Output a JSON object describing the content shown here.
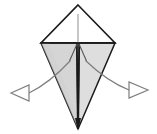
{
  "figure": {
    "title": "Origami fold step diagram",
    "canvas": {
      "width": 157,
      "height": 134,
      "background": "#ffffff"
    }
  },
  "colors": {
    "paper_outline": "#1a1a1a",
    "flap_left_fill": "#d5d5d5",
    "flap_right_fill": "#dedede",
    "top_face_fill": "#ffffff",
    "crease_line": "#9a9a9a",
    "arrow_stroke": "#7d7d7d",
    "arrow_fill": "#ffffff",
    "shadow_edge": "#8c8c8c"
  },
  "shape": {
    "name": "kite-base",
    "apex_top": {
      "x": 78,
      "y": 5
    },
    "vertex_left": {
      "x": 41,
      "y": 43
    },
    "vertex_right": {
      "x": 115,
      "y": 43
    },
    "apex_bottom": {
      "x": 78,
      "y": 129
    },
    "center_seam_x": 78
  },
  "creases": [
    {
      "name": "vertical-center-crease",
      "from": {
        "x": 78,
        "y": 14
      },
      "to": {
        "x": 78,
        "y": 43
      },
      "style": "valley"
    },
    {
      "name": "horizontal-flap-edge",
      "from": {
        "x": 41,
        "y": 43
      },
      "to": {
        "x": 115,
        "y": 43
      },
      "style": "edge"
    },
    {
      "name": "left-flap-inner-fold",
      "from": {
        "x": 70,
        "y": 61
      },
      "to": {
        "x": 78,
        "y": 43
      },
      "style": "mountain"
    },
    {
      "name": "right-flap-inner-fold",
      "from": {
        "x": 86,
        "y": 61
      },
      "to": {
        "x": 78,
        "y": 43
      },
      "style": "mountain"
    }
  ],
  "arrows": [
    {
      "name": "arrow-left-outward",
      "direction": "left",
      "tail": {
        "x": 70,
        "y": 61
      },
      "head_tip": {
        "x": 11,
        "y": 93
      },
      "head_base_top": {
        "x": 29,
        "y": 85
      },
      "head_base_bottom": {
        "x": 29,
        "y": 101
      },
      "style": "open-triangle"
    },
    {
      "name": "arrow-right-outward",
      "direction": "right",
      "tail": {
        "x": 86,
        "y": 61
      },
      "head_tip": {
        "x": 148,
        "y": 90
      },
      "head_base_top": {
        "x": 129,
        "y": 82
      },
      "head_base_bottom": {
        "x": 129,
        "y": 98
      },
      "style": "open-triangle"
    }
  ],
  "labels": {
    "step_number": "",
    "caption": ""
  }
}
